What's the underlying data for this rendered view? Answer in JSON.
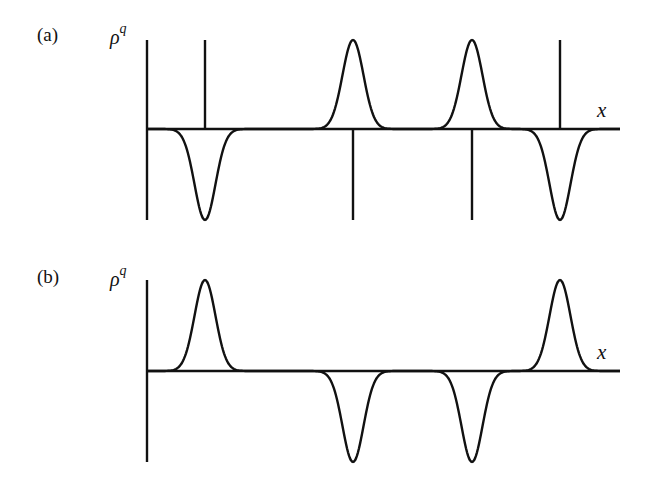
{
  "figure": {
    "panels": [
      {
        "label": "(a)",
        "ylabel_base": "ρ",
        "ylabel_sup": "q",
        "xlabel": "x",
        "axis": {
          "x0": 147,
          "x1": 620,
          "baseline": 129,
          "ytop": 40,
          "ybottom": 220
        },
        "gaussians": [
          {
            "center": 205,
            "sign": -1
          },
          {
            "center": 353,
            "sign": 1
          },
          {
            "center": 472,
            "sign": 1
          },
          {
            "center": 560,
            "sign": -1
          }
        ],
        "deltas": [
          {
            "x": 205,
            "sign": 1
          },
          {
            "x": 353,
            "sign": -1
          },
          {
            "x": 472,
            "sign": -1
          },
          {
            "x": 560,
            "sign": 1
          }
        ]
      },
      {
        "label": "(b)",
        "ylabel_base": "ρ",
        "ylabel_sup": "q",
        "xlabel": "x",
        "axis": {
          "x0": 147,
          "x1": 620,
          "baseline": 371,
          "ytop": 280,
          "ybottom": 462
        },
        "gaussians": [
          {
            "center": 205,
            "sign": 1
          },
          {
            "center": 353,
            "sign": -1
          },
          {
            "center": 472,
            "sign": -1
          },
          {
            "center": 560,
            "sign": 1
          }
        ],
        "deltas": []
      }
    ],
    "stroke_color": "#111111"
  }
}
